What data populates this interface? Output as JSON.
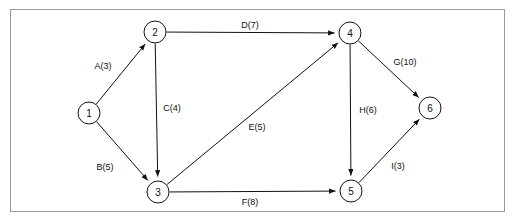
{
  "diagram": {
    "type": "directed-graph",
    "background_color": "#ffffff",
    "frame_color": "#9a9a9a",
    "stroke_color": "#111111",
    "nodes": [
      {
        "id": "1",
        "label": "1",
        "x": 89,
        "y": 113,
        "r": 11
      },
      {
        "id": "2",
        "label": "2",
        "x": 155,
        "y": 32,
        "r": 11
      },
      {
        "id": "3",
        "label": "3",
        "x": 158,
        "y": 192,
        "r": 11
      },
      {
        "id": "4",
        "label": "4",
        "x": 350,
        "y": 33,
        "r": 11
      },
      {
        "id": "5",
        "label": "5",
        "x": 351,
        "y": 191,
        "r": 11
      },
      {
        "id": "6",
        "label": "6",
        "x": 430,
        "y": 108,
        "r": 11
      }
    ],
    "edges": [
      {
        "id": "A",
        "label": "A(3)",
        "activity": "A",
        "weight": 3,
        "from": "1",
        "to": "2",
        "label_x": 103,
        "label_y": 66
      },
      {
        "id": "B",
        "label": "B(5)",
        "activity": "B",
        "weight": 5,
        "from": "1",
        "to": "3",
        "label_x": 105,
        "label_y": 167
      },
      {
        "id": "C",
        "label": "C(4)",
        "activity": "C",
        "weight": 4,
        "from": "2",
        "to": "3",
        "label_x": 172,
        "label_y": 108
      },
      {
        "id": "D",
        "label": "D(7)",
        "activity": "D",
        "weight": 7,
        "from": "2",
        "to": "4",
        "label_x": 250,
        "label_y": 25
      },
      {
        "id": "E",
        "label": "E(5)",
        "activity": "E",
        "weight": 5,
        "from": "3",
        "to": "4",
        "label_x": 257,
        "label_y": 127
      },
      {
        "id": "F",
        "label": "F(8)",
        "activity": "F",
        "weight": 8,
        "from": "3",
        "to": "5",
        "label_x": 250,
        "label_y": 202
      },
      {
        "id": "G",
        "label": "G(10)",
        "activity": "G",
        "weight": 10,
        "from": "4",
        "to": "6",
        "label_x": 405,
        "label_y": 62
      },
      {
        "id": "H",
        "label": "H(6)",
        "activity": "H",
        "weight": 6,
        "from": "4",
        "to": "5",
        "label_x": 368,
        "label_y": 110
      },
      {
        "id": "I",
        "label": "I(3)",
        "activity": "I",
        "weight": 3,
        "from": "5",
        "to": "6",
        "label_x": 398,
        "label_y": 166
      }
    ]
  }
}
